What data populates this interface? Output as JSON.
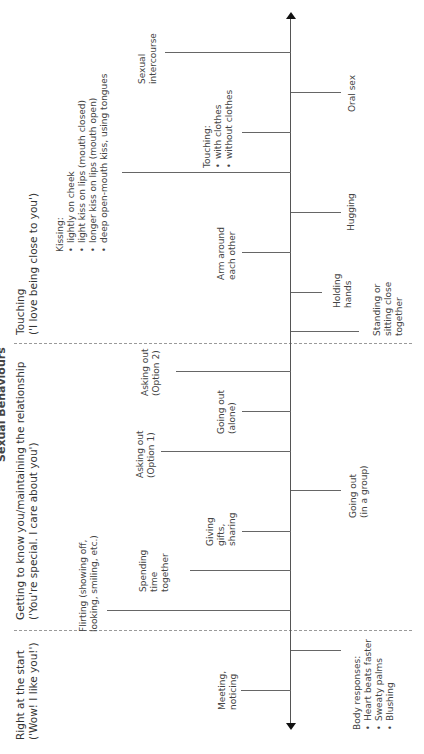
{
  "title": "Sexual Behaviours",
  "stages": [
    {
      "heading": "Right at the start",
      "subheading": "('Wow! I like you!')"
    },
    {
      "heading": "Getting to know you/maintaining the relationship",
      "subheading": "('You're special. I care about you')"
    },
    {
      "heading": "Touching",
      "subheading": "('I love being close to you')"
    }
  ],
  "events_left": [
    {
      "id": "meeting",
      "lines": [
        "Meeting,",
        "noticing"
      ]
    },
    {
      "id": "flirting",
      "lines": [
        "Flirting (showing off,",
        "looking, smiling, etc.)"
      ]
    },
    {
      "id": "spending",
      "lines": [
        "Spending",
        "time",
        "together"
      ]
    },
    {
      "id": "giving",
      "lines": [
        "Giving",
        "gifts,",
        "sharing"
      ]
    },
    {
      "id": "asking1",
      "lines": [
        "Asking out",
        "(Option 1)"
      ]
    },
    {
      "id": "going-alone",
      "lines": [
        "Going out",
        "(alone)"
      ]
    },
    {
      "id": "asking2",
      "lines": [
        "Asking out",
        "(Option 2)"
      ]
    },
    {
      "id": "arm",
      "lines": [
        "Arm around",
        "each other"
      ]
    },
    {
      "id": "kissing",
      "heading": "Kissing:",
      "items": [
        "lightly on cheek",
        "light kiss on lips (mouth closed)",
        "longer kiss on lips (mouth open)",
        "deep open-mouth kiss, using tongues"
      ]
    },
    {
      "id": "intercourse",
      "lines": [
        "Sexual",
        "intercourse"
      ]
    }
  ],
  "events_right": [
    {
      "id": "body",
      "heading": "Body responses:",
      "items": [
        "Heart beats faster",
        "Sweaty palms",
        "Blushing"
      ]
    },
    {
      "id": "going-group",
      "lines": [
        "Going out",
        "(in a group)"
      ]
    },
    {
      "id": "standing",
      "lines": [
        "Standing or",
        "sitting close",
        "together"
      ]
    },
    {
      "id": "holding",
      "lines": [
        "Holding",
        "hands"
      ]
    },
    {
      "id": "hugging",
      "lines": [
        "Hugging"
      ]
    },
    {
      "id": "touching",
      "heading": "Touching:",
      "items": [
        "with clothes",
        "without clothes"
      ]
    },
    {
      "id": "oral",
      "lines": [
        "Oral sex"
      ]
    }
  ]
}
